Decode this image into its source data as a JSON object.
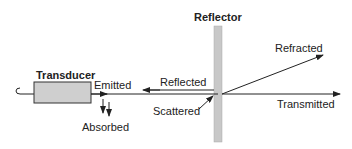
{
  "diagram": {
    "labels": {
      "reflector": "Reflector",
      "transducer": "Transducer",
      "emitted": "Emitted",
      "reflected": "Reflected",
      "scattered": "Scattered",
      "absorbed": "Absorbed",
      "refracted": "Refracted",
      "transmitted": "Transmitted"
    },
    "colors": {
      "reflector_fill": "#c8c8c8",
      "transducer_fill": "#cfcfcf",
      "line": "#222222"
    }
  }
}
